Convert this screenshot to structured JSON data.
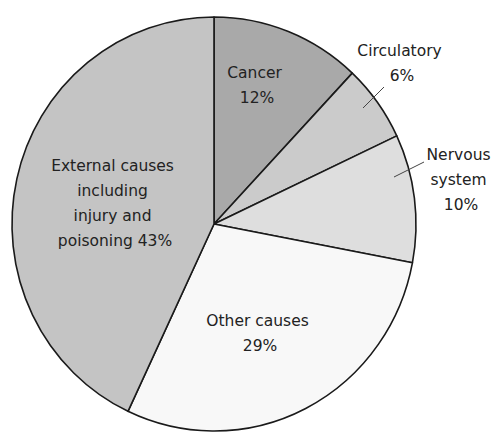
{
  "chart_data": {
    "type": "pie",
    "title": "",
    "start_angle_deg": 0,
    "direction": "clockwise",
    "slices": [
      {
        "label": "Cancer",
        "value": 12,
        "display": [
          "Cancer",
          "12%"
        ],
        "color": "#a9a9a9",
        "label_position": "inside"
      },
      {
        "label": "Circulatory",
        "value": 6,
        "display": [
          "Circulatory",
          "6%"
        ],
        "color": "#cbcbcb",
        "label_position": "outside-leader"
      },
      {
        "label": "Nervous system",
        "value": 10,
        "display": [
          "Nervous",
          "system",
          "10%"
        ],
        "color": "#dedede",
        "label_position": "outside-leader"
      },
      {
        "label": "Other causes",
        "value": 29,
        "display": [
          "Other causes",
          "29%"
        ],
        "color": "#f8f8f8",
        "label_position": "inside"
      },
      {
        "label": "External causes including injury and poisoning",
        "value": 43,
        "display": [
          "External causes",
          "including",
          "injury and",
          "poisoning 43%"
        ],
        "color": "#c4c4c4",
        "label_position": "inside"
      }
    ],
    "legend": "none",
    "stroke_color": "#1a1a1a"
  }
}
